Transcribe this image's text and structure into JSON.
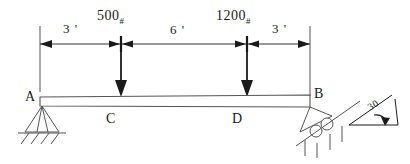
{
  "figure": {
    "line_color": "#1a1a1a",
    "beam_fill": "#ffffff"
  },
  "dimensions": [
    {
      "name": "left-span",
      "text": "3 '",
      "value": 3,
      "unit": "ft"
    },
    {
      "name": "middle-span",
      "text": "6 '",
      "value": 6,
      "unit": "ft"
    },
    {
      "name": "right-span",
      "text": "3 '",
      "value": 3,
      "unit": "ft"
    }
  ],
  "loads": [
    {
      "name": "load-at-c",
      "magnitude": "500",
      "unit": "#",
      "at": "C",
      "direction": "down"
    },
    {
      "name": "load-at-d",
      "magnitude": "1200",
      "unit": "#",
      "at": "D",
      "direction": "down"
    }
  ],
  "points": [
    {
      "name": "point-a",
      "label": "A"
    },
    {
      "name": "point-b",
      "label": "B"
    },
    {
      "name": "point-c",
      "label": "C"
    },
    {
      "name": "point-d",
      "label": "D"
    }
  ],
  "supports": {
    "left": {
      "type": "pin",
      "label": "A"
    },
    "right": {
      "type": "roller-on-incline",
      "label": "B",
      "angle_text": "30",
      "angle_value": 30
    }
  }
}
